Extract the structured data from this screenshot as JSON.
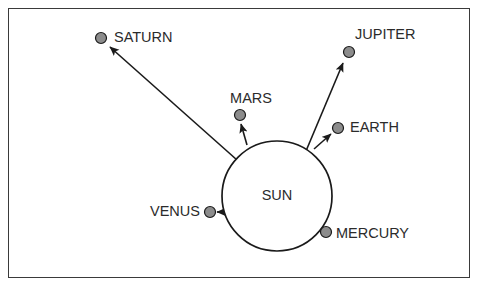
{
  "diagram": {
    "frame": {
      "x": 8,
      "y": 8,
      "width": 462,
      "height": 270,
      "stroke_color": "#3a3a3a"
    },
    "background_color": "#ffffff",
    "sun": {
      "label": "SUN",
      "center_x": 277,
      "center_y": 196,
      "radius": 55,
      "stroke_color": "#1a1a1a",
      "fill_color": "#ffffff",
      "label_x": 277,
      "label_y": 196
    },
    "planet_style": {
      "fill_color": "#8c8c8c",
      "stroke_color": "#1a1a1a",
      "radius": 5.5
    },
    "arrow_color": "#1a1a1a",
    "planets": [
      {
        "name": "SATURN",
        "dot_x": 101,
        "dot_y": 38,
        "label_x": 114,
        "label_y": 38,
        "label_anchor": "start",
        "arrow": {
          "x1": 237,
          "y1": 160,
          "x2": 110,
          "y2": 47
        }
      },
      {
        "name": "JUPITER",
        "dot_x": 349,
        "dot_y": 52,
        "label_x": 355,
        "label_y": 35,
        "label_anchor": "start",
        "arrow": {
          "x1": 306,
          "y1": 151,
          "x2": 343,
          "y2": 63
        }
      },
      {
        "name": "MARS",
        "dot_x": 240,
        "dot_y": 115,
        "label_x": 251,
        "label_y": 99,
        "label_anchor": "middle",
        "arrow": {
          "x1": 247,
          "y1": 145,
          "x2": 241,
          "y2": 124
        }
      },
      {
        "name": "EARTH",
        "dot_x": 338,
        "dot_y": 128,
        "label_x": 350,
        "label_y": 128,
        "label_anchor": "start",
        "arrow": {
          "x1": 314,
          "y1": 149,
          "x2": 331,
          "y2": 134
        }
      },
      {
        "name": "VENUS",
        "dot_x": 210,
        "dot_y": 212,
        "label_x": 200,
        "label_y": 212,
        "label_anchor": "end",
        "arrow": {
          "x1": 224,
          "y1": 212,
          "x2": 217,
          "y2": 212
        }
      },
      {
        "name": "MERCURY",
        "dot_x": 326,
        "dot_y": 232,
        "label_x": 336,
        "label_y": 234,
        "label_anchor": "start",
        "arrow": null
      }
    ]
  }
}
